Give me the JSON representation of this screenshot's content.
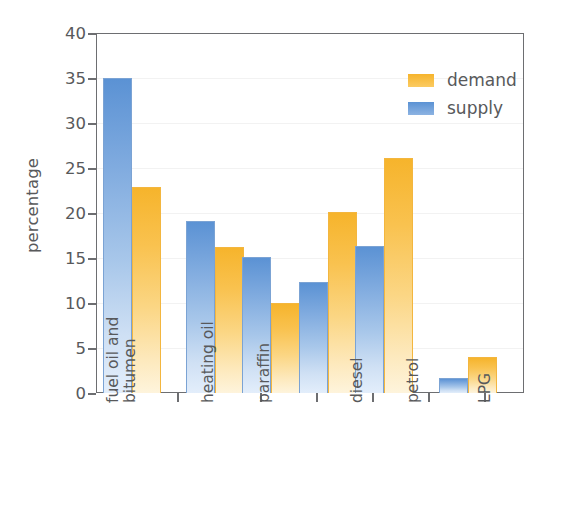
{
  "chart_data": {
    "type": "bar",
    "title": "",
    "xlabel": "",
    "ylabel": "percentage",
    "ylim": [
      0,
      40
    ],
    "ytick_step": 5,
    "yticks": [
      "40",
      "35",
      "30",
      "25",
      "20",
      "15",
      "10",
      "5",
      "0"
    ],
    "grid": false,
    "legend_position": "top-right",
    "categories": [
      "fuel oil and bitumen",
      "heating oil",
      "paraffin",
      "diesel",
      "petrol",
      "LPG"
    ],
    "category_lines": [
      [
        "fuel oil and",
        "bitumen"
      ],
      [
        "heating oil"
      ],
      [
        "paraffin"
      ],
      [
        "diesel"
      ],
      [
        "petrol"
      ],
      [
        "LPG"
      ]
    ],
    "series": [
      {
        "name": "supply",
        "color": "#5b92d4",
        "values": [
          35.0,
          19.1,
          15.1,
          12.3,
          16.3,
          1.7
        ]
      },
      {
        "name": "demand",
        "color": "#f6b42c",
        "values": [
          22.9,
          16.2,
          10.0,
          20.1,
          26.1,
          4.0
        ]
      }
    ],
    "legend": [
      {
        "label": "demand",
        "color": "#f6b42c"
      },
      {
        "label": "supply",
        "color": "#5b92d4"
      }
    ],
    "colors": {
      "supply_top": "#5b92d4",
      "supply_bottom": "#e3eefb",
      "demand_top": "#f6b42c",
      "demand_bottom": "#fef4dc",
      "axis": "#6d6e71",
      "text": "#58595b"
    }
  }
}
